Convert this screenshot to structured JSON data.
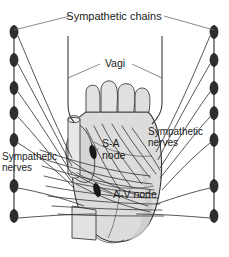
{
  "figure": {
    "name": "cardiac-innervation-diagram",
    "background_color": "#ffffff",
    "width": 229,
    "height": 257
  },
  "labels": {
    "sympathetic_chains": "Sympathetic chains",
    "vagi": "Vagi",
    "sympathetic_nerves_right": "Sympathetic",
    "sympathetic_nerves_right_line2": "nerves",
    "sympathetic_nerves_left": "Sympathetic",
    "sympathetic_nerves_left_line2": "nerves",
    "sa_node": "S-A",
    "sa_node_line2": "node",
    "av_node": "A-V node"
  },
  "colors": {
    "outline": "#3c3c3c",
    "heart_fill": "#d9d9d9",
    "heart_fill_light": "#e6e6e6",
    "nerve_line": "#2b2b2b",
    "leader_line": "#6b6b6b",
    "chain_line": "#4a4a4a",
    "ganglion_fill": "#2e2e2e",
    "node_fill": "#1a1a1a",
    "text": "#1a1a1a"
  },
  "structures": {
    "sympathetic_chain_left": {
      "name": "left-sympathetic-chain",
      "x": 14,
      "y_top": 30,
      "y_bottom": 222,
      "ganglia_y": [
        32,
        60,
        88,
        113,
        140,
        186,
        216
      ]
    },
    "sympathetic_chain_right": {
      "name": "right-sympathetic-chain",
      "x": 214,
      "y_top": 30,
      "y_bottom": 222,
      "ganglia_y": [
        32,
        60,
        88,
        113,
        140,
        186,
        216
      ]
    },
    "vagus_left": {
      "name": "left-vagus-trunk",
      "x": 68,
      "y_top": 36,
      "y_bottom": 120
    },
    "vagus_right": {
      "name": "right-vagus-trunk",
      "x": 162,
      "y_top": 36,
      "y_bottom": 120
    },
    "sa_node_marker": {
      "cx": 93,
      "cy": 152,
      "rx": 3,
      "ry": 7
    },
    "av_node_marker": {
      "cx": 97,
      "cy": 190,
      "rx": 3,
      "ry": 7
    }
  }
}
